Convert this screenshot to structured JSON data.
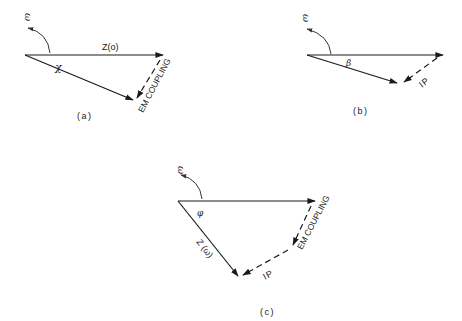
{
  "figure": {
    "panels": [
      {
        "id": "a",
        "caption": "(a)",
        "rotation_label": "ω",
        "angle_label": "χ",
        "top_vector_label": "Z(o)",
        "dashed_vector_label": "EM COUPLING"
      },
      {
        "id": "b",
        "caption": "(b)",
        "rotation_label": "ω",
        "angle_label": "β",
        "dashed_vector_label": "IP"
      },
      {
        "id": "c",
        "caption": "(c)",
        "rotation_label": "ω",
        "angle_label": "φ",
        "diagonal_vector_label": "Z (ω)",
        "dashed_vector_label_1": "EM COUPLING",
        "dashed_vector_label_2": "IP"
      }
    ],
    "colors": {
      "ink": "#1a1a1a",
      "background": "#ffffff"
    }
  }
}
